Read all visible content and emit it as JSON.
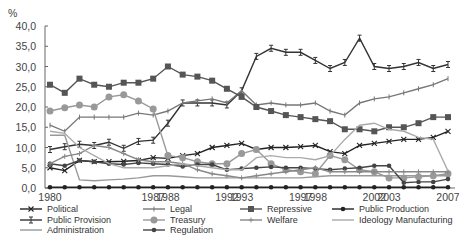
{
  "chart_data": {
    "type": "line",
    "title": "",
    "xlabel": "",
    "ylabel": "%",
    "ylim": [
      0,
      40
    ],
    "yticks": [
      "0,0",
      "5,0",
      "10,0",
      "15,0",
      "20,0",
      "25,0",
      "30,0",
      "35,0",
      "40,0"
    ],
    "x": [
      1980,
      1981,
      1982,
      1983,
      1984,
      1985,
      1986,
      1987,
      1988,
      1989,
      1990,
      1991,
      1992,
      1993,
      1994,
      1995,
      1996,
      1997,
      1998,
      1999,
      2000,
      2001,
      2002,
      2003,
      2004,
      2005,
      2006,
      2007
    ],
    "xtick_labels": [
      "1980",
      "1987",
      "1988",
      "1992",
      "1993",
      "1997",
      "1998",
      "2002",
      "2003",
      "2007"
    ],
    "grid": false,
    "legend_position": "bottom",
    "series": [
      {
        "name": "Political",
        "color": "#222222",
        "marker": "x",
        "values": [
          5.0,
          4.3,
          6.8,
          6.5,
          6.5,
          6.6,
          6.8,
          7.5,
          7.3,
          8.0,
          8.5,
          10.0,
          10.5,
          11.0,
          9.5,
          10.0,
          10.0,
          10.2,
          10.5,
          9.0,
          8.5,
          10.5,
          11.0,
          11.5,
          12.0,
          12.0,
          12.5,
          14.0
        ]
      },
      {
        "name": "Public Provision",
        "color": "#333333",
        "marker": "cross",
        "values": [
          9.5,
          10.2,
          10.8,
          10.5,
          11.3,
          9.8,
          11.5,
          11.8,
          16.0,
          21.0,
          21.0,
          21.0,
          20.5,
          24.0,
          32.5,
          34.5,
          33.5,
          33.5,
          31.5,
          29.5,
          31.0,
          37.0,
          30.0,
          29.5,
          30.0,
          31.0,
          29.5,
          30.5
        ]
      },
      {
        "name": "Administration",
        "color": "#999999",
        "marker": "none",
        "values": [
          13.0,
          13.0,
          2.0,
          1.8,
          2.0,
          2.2,
          2.5,
          3.0,
          3.0,
          2.8,
          2.5,
          2.5,
          2.5,
          2.5,
          2.5,
          2.5,
          2.5,
          2.5,
          2.8,
          3.0,
          3.0,
          3.0,
          3.0,
          3.0,
          3.0,
          3.0,
          3.0,
          3.0
        ]
      },
      {
        "name": "Legal",
        "color": "#777777",
        "marker": "tick",
        "values": [
          15.5,
          14.0,
          17.5,
          17.5,
          17.5,
          17.5,
          18.5,
          18.0,
          19.0,
          21.0,
          21.5,
          22.0,
          21.0,
          24.0,
          20.5,
          21.0,
          20.5,
          20.5,
          21.0,
          19.0,
          18.0,
          21.0,
          22.0,
          22.5,
          23.5,
          24.5,
          25.5,
          27.0
        ]
      },
      {
        "name": "Treasury",
        "color": "#999999",
        "marker": "circle",
        "values": [
          19.0,
          19.8,
          20.5,
          20.0,
          22.5,
          23.0,
          21.5,
          19.5,
          8.0,
          7.5,
          6.5,
          6.0,
          6.0,
          8.5,
          9.5,
          6.0,
          4.5,
          4.0,
          3.5,
          8.0,
          7.0,
          4.5,
          4.0,
          2.5,
          2.5,
          2.8,
          3.0,
          3.5
        ]
      },
      {
        "name": "Regulation",
        "color": "#444444",
        "marker": "dot",
        "values": [
          6.0,
          5.5,
          6.8,
          6.5,
          6.0,
          5.8,
          6.2,
          6.0,
          5.8,
          5.3,
          5.8,
          5.8,
          4.5,
          4.8,
          5.0,
          5.2,
          5.0,
          5.0,
          4.8,
          4.5,
          4.8,
          5.0,
          5.5,
          5.5,
          1.3,
          1.5,
          1.5,
          2.2
        ]
      },
      {
        "name": "Repressive",
        "color": "#555555",
        "marker": "square",
        "values": [
          25.5,
          23.5,
          27.0,
          25.5,
          25.0,
          26.0,
          26.0,
          27.0,
          30.0,
          28.0,
          27.5,
          26.5,
          24.5,
          22.5,
          20.0,
          19.0,
          18.0,
          17.5,
          17.0,
          16.5,
          14.5,
          14.5,
          14.0,
          15.0,
          15.0,
          16.0,
          17.5,
          17.5
        ]
      },
      {
        "name": "Welfare",
        "color": "#888888",
        "marker": "plus",
        "values": [
          6.0,
          7.8,
          8.5,
          10.5,
          10.0,
          8.5,
          7.0,
          6.5,
          6.5,
          6.0,
          4.5,
          3.5,
          3.0,
          2.5,
          3.0,
          3.5,
          4.0,
          4.5,
          5.0,
          4.0,
          4.0,
          4.0,
          4.0,
          4.0,
          4.0,
          4.0,
          4.0,
          4.0
        ]
      },
      {
        "name": "Public Production",
        "color": "#222222",
        "marker": "dot",
        "values": [
          0.2,
          0.2,
          0.2,
          0.2,
          0.2,
          0.2,
          0.2,
          0.2,
          0.2,
          0.2,
          0.2,
          0.2,
          0.2,
          0.2,
          0.2,
          0.2,
          0.2,
          0.2,
          0.2,
          0.2,
          0.2,
          0.2,
          0.2,
          0.2,
          0.2,
          0.2,
          0.2,
          0.2
        ]
      },
      {
        "name": "Ideology Manufacturing",
        "color": "#aaaaaa",
        "marker": "none",
        "values": [
          14.0,
          13.5,
          10.0,
          8.0,
          6.0,
          5.0,
          5.0,
          5.0,
          5.5,
          6.0,
          5.5,
          5.0,
          4.5,
          4.5,
          7.5,
          8.0,
          7.5,
          7.5,
          7.0,
          8.0,
          12.0,
          15.5,
          16.0,
          14.5,
          14.0,
          12.5,
          12.0,
          4.2
        ]
      }
    ],
    "legend": [
      [
        "Political",
        "Legal",
        "Repressive",
        "Public Production"
      ],
      [
        "Public Provision",
        "Treasury",
        "Welfare",
        "Ideology Manufacturing"
      ],
      [
        "Administration",
        "Regulation"
      ]
    ]
  },
  "axis": {
    "unit_label": "%"
  }
}
